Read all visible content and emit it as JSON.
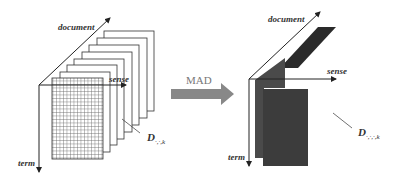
{
  "diagram": {
    "left_tensor": {
      "axes": {
        "document": "document",
        "sense": "sense",
        "term": "term"
      },
      "slice_label": {
        "base": "D",
        "subscript": "·,·,k"
      },
      "slice_count": 8
    },
    "transform": {
      "label": "MAD"
    },
    "right_tensor": {
      "axes": {
        "document": "document",
        "sense": "sense",
        "term": "term"
      },
      "slice_label": {
        "base": "D",
        "subscript": "·,·,·,k"
      }
    },
    "colors": {
      "line": "#222222",
      "arrow": "#888888",
      "dark_slab": "#2a2a2a",
      "mid_slab": "#4a4a4a",
      "grid": "#666666"
    }
  }
}
